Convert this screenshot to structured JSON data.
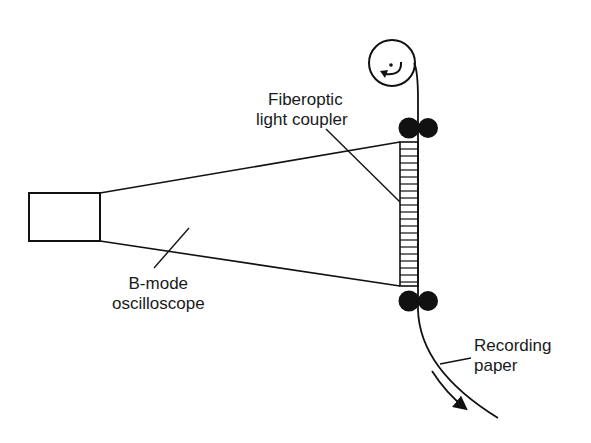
{
  "diagram": {
    "labels": {
      "coupler_line1": "Fiberoptic",
      "coupler_line2": "light coupler",
      "scope_line1": "B-mode",
      "scope_line2": "oscilloscope",
      "paper_line1": "Recording",
      "paper_line2": "paper"
    },
    "colors": {
      "ink": "#111111",
      "background": "#ffffff"
    }
  }
}
